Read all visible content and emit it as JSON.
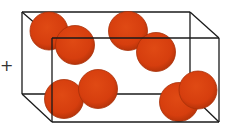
{
  "diagram": {
    "operator_symbol": "+",
    "container": {
      "type": "rectangular-box-wireframe",
      "stroke_color": "#1a1a1a",
      "back_face": {
        "x1": 22,
        "y1": 12,
        "x2": 190,
        "y2": 94
      },
      "front_face": {
        "x1": 52,
        "y1": 38,
        "x2": 219,
        "y2": 122
      }
    },
    "particle_color": "#D8400F",
    "particle_edge_color": "#A83008",
    "molecules": [
      {
        "name": "molecule-1",
        "atoms": [
          {
            "cx": 49,
            "cy": 31,
            "r": 19
          },
          {
            "cx": 75,
            "cy": 45,
            "r": 19.5
          }
        ]
      },
      {
        "name": "molecule-2",
        "atoms": [
          {
            "cx": 128,
            "cy": 31,
            "r": 19.5
          },
          {
            "cx": 156,
            "cy": 52,
            "r": 19.5
          }
        ]
      },
      {
        "name": "molecule-3",
        "atoms": [
          {
            "cx": 64,
            "cy": 99,
            "r": 19.5
          },
          {
            "cx": 98,
            "cy": 89,
            "r": 19.5
          }
        ]
      },
      {
        "name": "molecule-4",
        "atoms": [
          {
            "cx": 179,
            "cy": 102,
            "r": 19.5
          },
          {
            "cx": 198,
            "cy": 90,
            "r": 19
          }
        ]
      }
    ]
  }
}
